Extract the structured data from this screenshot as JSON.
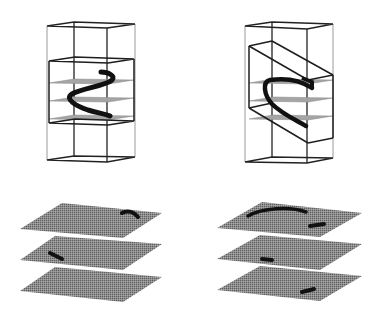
{
  "figure": {
    "colors": {
      "background": "#ffffff",
      "frame_light": "#8a8a8a",
      "frame_dark": "#1e1e1e",
      "slice_plane": "#9c9c9c",
      "slice_texture": "#6e6e6e",
      "trajectory": "#111111"
    },
    "panels": [
      {
        "id": "top-left",
        "content": "bounding box with inner box, three slice planes, helix curve"
      },
      {
        "id": "top-right",
        "content": "bounding box with slanted inner box, three slice planes, parabolic arc"
      },
      {
        "id": "bottom-left",
        "content": "three stacked textured slices with intersection marks"
      },
      {
        "id": "bottom-right",
        "content": "three stacked textured slices with intersection marks"
      }
    ]
  }
}
